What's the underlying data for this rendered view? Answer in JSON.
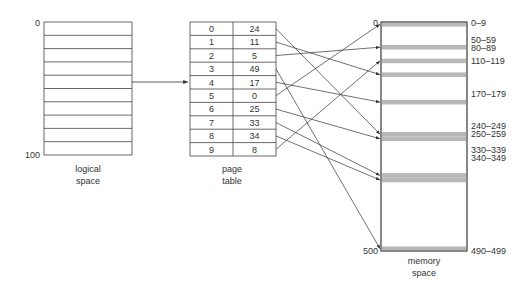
{
  "logical_space": {
    "label_line1": "logical",
    "label_line2": "space",
    "top_label": "0",
    "bottom_label": "100",
    "rows": 10
  },
  "page_table": {
    "label_line1": "page",
    "label_line2": "table",
    "rows": [
      {
        "page": "0",
        "frame": "24"
      },
      {
        "page": "1",
        "frame": "11"
      },
      {
        "page": "2",
        "frame": "5"
      },
      {
        "page": "3",
        "frame": "49"
      },
      {
        "page": "4",
        "frame": "17"
      },
      {
        "page": "5",
        "frame": "0"
      },
      {
        "page": "6",
        "frame": "25"
      },
      {
        "page": "7",
        "frame": "33"
      },
      {
        "page": "8",
        "frame": "34"
      },
      {
        "page": "9",
        "frame": "8"
      }
    ]
  },
  "memory_space": {
    "label_line1": "memory",
    "label_line2": "space",
    "top_label": "0",
    "bottom_label": "500",
    "frames": [
      {
        "label": "0–9",
        "start": 0
      },
      {
        "label": "50–59",
        "start": 50
      },
      {
        "label": "80–89",
        "start": 80
      },
      {
        "label": "110–119",
        "start": 110
      },
      {
        "label": "170–179",
        "start": 170
      },
      {
        "label": "240–249",
        "start": 240
      },
      {
        "label": "250–259",
        "start": 250
      },
      {
        "label": "330–339",
        "start": 330
      },
      {
        "label": "340–349",
        "start": 340
      },
      {
        "label": "490–499",
        "start": 490
      }
    ],
    "frame_color": "#b8b8b8"
  }
}
